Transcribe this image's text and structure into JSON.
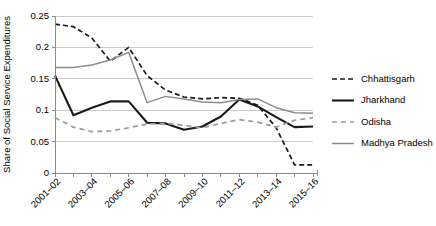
{
  "chart_data": {
    "type": "line",
    "title": "",
    "xlabel": "",
    "ylabel": "Share of Social Service Expenditures",
    "ylim": [
      0,
      0.25
    ],
    "ytick_values": [
      0,
      0.05,
      0.1,
      0.15,
      0.2,
      0.25
    ],
    "ytick_labels": [
      "0",
      "0.05",
      "0.1",
      "0.15",
      "0.2",
      "0.25"
    ],
    "grid": "horizontal",
    "legend_position": "right",
    "categories": [
      "2001-02",
      "2002-03",
      "2003-04",
      "2004-05",
      "2005-06",
      "2006-07",
      "2007-08",
      "2008-09",
      "2009-10",
      "2010-11",
      "2011-12",
      "2012-13",
      "2013-14",
      "2014-15",
      "2015-16"
    ],
    "xtick_labels_shown": [
      "2001–02",
      "2003–04",
      "2005–06",
      "2007–08",
      "2009–10",
      "2011–12",
      "2013–14",
      "2015–16"
    ],
    "series": [
      {
        "name": "Chhattisgarh",
        "style": "dashed",
        "color": "#1a1a1a",
        "width": 1.7,
        "dash": "5,3",
        "values": [
          0.237,
          0.233,
          0.215,
          0.178,
          0.2,
          0.155,
          0.132,
          0.121,
          0.118,
          0.12,
          0.119,
          0.108,
          0.072,
          0.013,
          0.013
        ]
      },
      {
        "name": "Jharkhand",
        "style": "solid",
        "color": "#1a1a1a",
        "width": 2.1,
        "dash": "none",
        "values": [
          0.155,
          0.092,
          0.104,
          0.114,
          0.114,
          0.08,
          0.079,
          0.069,
          0.074,
          0.09,
          0.117,
          0.106,
          0.089,
          0.073,
          0.074
        ]
      },
      {
        "name": "Odisha",
        "style": "dashed",
        "color": "#9a9a9a",
        "width": 1.7,
        "dash": "5,4",
        "values": [
          0.088,
          0.073,
          0.066,
          0.067,
          0.072,
          0.078,
          0.079,
          0.076,
          0.072,
          0.079,
          0.085,
          0.081,
          0.073,
          0.084,
          0.088
        ]
      },
      {
        "name": "Madhya Pradesh",
        "style": "solid",
        "color": "#8c8c8c",
        "width": 1.5,
        "dash": "none",
        "values": [
          0.168,
          0.168,
          0.172,
          0.18,
          0.192,
          0.112,
          0.122,
          0.118,
          0.113,
          0.112,
          0.117,
          0.118,
          0.104,
          0.096,
          0.095
        ]
      }
    ]
  },
  "legend": {
    "entries": [
      {
        "label": "Chhattisgarh"
      },
      {
        "label": "Jharkhand"
      },
      {
        "label": "Odisha"
      },
      {
        "label": "Madhya Pradesh"
      }
    ]
  }
}
